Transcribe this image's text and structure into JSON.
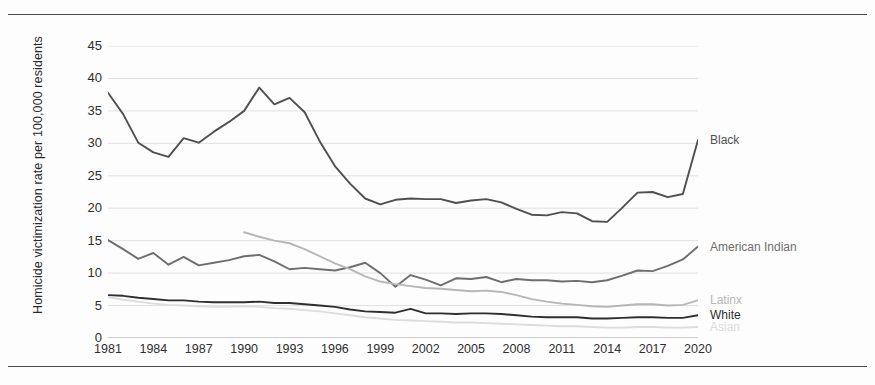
{
  "figure": {
    "ylabel": "Homicide victimization rate per 100,000 residents",
    "top_rule": "horizontal-rule",
    "bottom_rule": "horizontal-rule"
  },
  "chart_data": {
    "type": "line",
    "title": "",
    "subtitle": "",
    "xlabel": "",
    "ylabel": "Homicide victimization rate per 100,000 residents",
    "xlim": [
      1981,
      2020
    ],
    "ylim": [
      0,
      45
    ],
    "ytick_labels": [
      "0",
      "5",
      "10",
      "15",
      "20",
      "25",
      "30",
      "35",
      "40",
      "45"
    ],
    "ytick_values": [
      0,
      5,
      10,
      15,
      20,
      25,
      30,
      35,
      40,
      45
    ],
    "xtick_labels": [
      "1981",
      "1984",
      "1987",
      "1990",
      "1993",
      "1996",
      "1999",
      "2002",
      "2005",
      "2008",
      "2011",
      "2014",
      "2017",
      "2020"
    ],
    "xtick_values": [
      1981,
      1984,
      1987,
      1990,
      1993,
      1996,
      1999,
      2002,
      2005,
      2008,
      2011,
      2014,
      2017,
      2020
    ],
    "grid": true,
    "grid_axis": "y",
    "legend_position": "right-of-line-ends",
    "x": [
      1981,
      1982,
      1983,
      1984,
      1985,
      1986,
      1987,
      1988,
      1989,
      1990,
      1991,
      1992,
      1993,
      1994,
      1995,
      1996,
      1997,
      1998,
      1999,
      2000,
      2001,
      2002,
      2003,
      2004,
      2005,
      2006,
      2007,
      2008,
      2009,
      2010,
      2011,
      2012,
      2013,
      2014,
      2015,
      2016,
      2017,
      2018,
      2019,
      2020
    ],
    "series": [
      {
        "name": "Black",
        "color": "#4f4f4f",
        "label_value": 30.5,
        "values": [
          37.8,
          34.5,
          30.1,
          28.6,
          27.9,
          30.8,
          30.1,
          31.8,
          33.3,
          35.0,
          38.6,
          36.0,
          37.0,
          34.8,
          30.3,
          26.5,
          23.8,
          21.5,
          20.6,
          21.3,
          21.5,
          21.4,
          21.4,
          20.8,
          21.2,
          21.4,
          20.9,
          19.9,
          19.0,
          18.9,
          19.4,
          19.2,
          18.0,
          17.9,
          20.1,
          22.4,
          22.5,
          21.7,
          22.2,
          30.5
        ]
      },
      {
        "name": "American Indian",
        "color": "#6e6e6e",
        "label_value": 14.1,
        "values": [
          15.1,
          13.7,
          12.2,
          13.1,
          11.3,
          12.5,
          11.2,
          11.6,
          12.0,
          12.6,
          12.8,
          11.8,
          10.6,
          10.8,
          10.6,
          10.4,
          10.9,
          11.6,
          10.0,
          7.9,
          9.7,
          9.0,
          8.1,
          9.2,
          9.1,
          9.4,
          8.6,
          9.1,
          8.9,
          8.9,
          8.7,
          8.8,
          8.6,
          8.9,
          9.6,
          10.4,
          10.3,
          11.1,
          12.1,
          14.1
        ]
      },
      {
        "name": "Latinx",
        "color": "#b6b6b6",
        "label_value": 5.8,
        "values": [
          null,
          null,
          null,
          null,
          null,
          null,
          null,
          null,
          null,
          16.3,
          15.6,
          15.0,
          14.6,
          13.7,
          12.6,
          11.5,
          10.6,
          9.5,
          8.7,
          8.3,
          8.0,
          7.7,
          7.6,
          7.4,
          7.2,
          7.3,
          7.1,
          6.6,
          6.0,
          5.6,
          5.3,
          5.1,
          4.9,
          4.8,
          5.0,
          5.2,
          5.2,
          5.0,
          5.1,
          5.8
        ]
      },
      {
        "name": "White",
        "color": "#2f2f2f",
        "label_value": 3.5,
        "values": [
          6.6,
          6.5,
          6.2,
          6.0,
          5.8,
          5.8,
          5.6,
          5.5,
          5.5,
          5.5,
          5.6,
          5.4,
          5.4,
          5.2,
          5.0,
          4.8,
          4.4,
          4.1,
          4.0,
          3.9,
          4.5,
          3.8,
          3.8,
          3.7,
          3.8,
          3.8,
          3.7,
          3.5,
          3.3,
          3.2,
          3.2,
          3.2,
          3.0,
          3.0,
          3.1,
          3.2,
          3.2,
          3.1,
          3.1,
          3.5
        ]
      },
      {
        "name": "Asian",
        "color": "#dcdcdc",
        "label_value": 1.7,
        "values": [
          6.3,
          5.9,
          5.6,
          5.3,
          5.1,
          5.0,
          4.9,
          4.8,
          4.8,
          4.9,
          4.8,
          4.6,
          4.5,
          4.3,
          4.1,
          3.8,
          3.5,
          3.2,
          3.0,
          2.8,
          2.7,
          2.6,
          2.5,
          2.4,
          2.4,
          2.3,
          2.2,
          2.1,
          2.0,
          1.9,
          1.8,
          1.8,
          1.7,
          1.6,
          1.6,
          1.7,
          1.7,
          1.6,
          1.6,
          1.7
        ]
      }
    ]
  }
}
